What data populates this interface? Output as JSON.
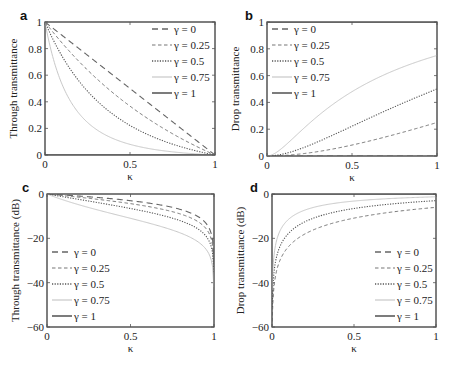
{
  "figure": {
    "legend_prefix": "γ = ",
    "xlabel": "κ"
  },
  "chart_data": [
    {
      "panel": "a",
      "type": "line",
      "title": "",
      "xlabel": "κ",
      "ylabel": "Through transmittance",
      "xlim": [
        0,
        1
      ],
      "ylim": [
        0,
        1
      ],
      "xticks": [
        "0",
        "0.5",
        "1"
      ],
      "yticks": [
        "0",
        "0.2",
        "0.4",
        "0.6",
        "0.8",
        "1"
      ],
      "legend_position": "upper right",
      "grid": false,
      "x": [
        0,
        0.1,
        0.2,
        0.3,
        0.4,
        0.5,
        0.6,
        0.7,
        0.8,
        0.9,
        1.0
      ],
      "series": [
        {
          "name": "γ = 0",
          "values": [
            1.0,
            0.9,
            0.8,
            0.7,
            0.6,
            0.5,
            0.4,
            0.3,
            0.2,
            0.1,
            0.0
          ]
        },
        {
          "name": "γ = 0.25",
          "values": [
            1.0,
            0.84,
            0.69,
            0.56,
            0.44,
            0.33,
            0.24,
            0.16,
            0.09,
            0.04,
            0.0
          ]
        },
        {
          "name": "γ = 0.5",
          "values": [
            1.0,
            0.74,
            0.56,
            0.41,
            0.31,
            0.22,
            0.16,
            0.1,
            0.06,
            0.02,
            0.0
          ]
        },
        {
          "name": "γ = 0.75",
          "values": [
            1.0,
            0.53,
            0.31,
            0.19,
            0.12,
            0.08,
            0.05,
            0.03,
            0.02,
            0.01,
            0.0
          ]
        },
        {
          "name": "γ = 1",
          "values": [
            0,
            0,
            0,
            0,
            0,
            0,
            0,
            0,
            0,
            0,
            0
          ]
        }
      ]
    },
    {
      "panel": "b",
      "type": "line",
      "title": "",
      "xlabel": "κ",
      "ylabel": "Drop transmittance",
      "xlim": [
        0,
        1
      ],
      "ylim": [
        0,
        1
      ],
      "xticks": [
        "0",
        "0.5",
        "1"
      ],
      "yticks": [
        "0",
        "0.2",
        "0.4",
        "0.6",
        "0.8",
        "1"
      ],
      "legend_position": "upper left",
      "grid": false,
      "x": [
        0,
        0.1,
        0.2,
        0.3,
        0.4,
        0.5,
        0.6,
        0.7,
        0.8,
        0.9,
        1.0
      ],
      "series": [
        {
          "name": "γ = 0",
          "values": [
            0,
            0,
            0,
            0,
            0,
            0,
            0,
            0,
            0,
            0,
            0
          ]
        },
        {
          "name": "γ = 0.25",
          "values": [
            0.0,
            0.004,
            0.016,
            0.035,
            0.058,
            0.082,
            0.11,
            0.14,
            0.17,
            0.21,
            0.25
          ]
        },
        {
          "name": "γ = 0.5",
          "values": [
            0.0,
            0.017,
            0.056,
            0.1,
            0.16,
            0.22,
            0.28,
            0.34,
            0.4,
            0.45,
            0.5
          ]
        },
        {
          "name": "γ = 0.75",
          "values": [
            0.0,
            0.064,
            0.19,
            0.3,
            0.39,
            0.48,
            0.55,
            0.61,
            0.66,
            0.71,
            0.75
          ]
        },
        {
          "name": "γ = 1",
          "values": [
            1,
            1,
            1,
            1,
            1,
            1,
            1,
            1,
            1,
            1,
            1
          ]
        }
      ]
    },
    {
      "panel": "c",
      "type": "line",
      "title": "",
      "xlabel": "κ",
      "ylabel": "Through transmittance (dB)",
      "xlim": [
        0,
        1
      ],
      "ylim": [
        -60,
        0
      ],
      "xticks": [
        "0",
        "0.5",
        "1"
      ],
      "yticks": [
        "-60",
        "-40",
        "-20",
        "0"
      ],
      "legend_position": "lower left",
      "grid": false,
      "x": [
        0,
        0.1,
        0.2,
        0.3,
        0.4,
        0.5,
        0.6,
        0.7,
        0.8,
        0.9,
        0.95,
        0.99
      ],
      "series": [
        {
          "name": "γ = 0",
          "values": [
            0,
            -0.46,
            -0.97,
            -1.55,
            -2.22,
            -3.01,
            -3.98,
            -5.23,
            -6.99,
            -10.0,
            -13.0,
            -20.0
          ]
        },
        {
          "name": "γ = 0.25",
          "values": [
            0,
            -0.76,
            -1.61,
            -2.52,
            -3.57,
            -4.81,
            -6.2,
            -7.96,
            -10.5,
            -14.0,
            -17.3,
            -24.4
          ]
        },
        {
          "name": "γ = 0.5",
          "values": [
            0,
            -1.3,
            -2.5,
            -3.8,
            -5.1,
            -6.5,
            -8.0,
            -10.0,
            -12.2,
            -16.0,
            -19.3,
            -26.5
          ]
        },
        {
          "name": "γ = 0.75",
          "values": [
            0,
            -2.8,
            -5.1,
            -7.2,
            -9.2,
            -11.0,
            -13.0,
            -15.2,
            -17.7,
            -21.4,
            -24.7,
            -31.9
          ]
        },
        {
          "name": "γ = 1",
          "values": [
            null,
            null,
            null,
            null,
            null,
            null,
            null,
            null,
            null,
            null,
            null,
            null
          ]
        }
      ]
    },
    {
      "panel": "d",
      "type": "line",
      "title": "",
      "xlabel": "κ",
      "ylabel": "Drop transmittance (dB)",
      "xlim": [
        0,
        1
      ],
      "ylim": [
        -60,
        0
      ],
      "xticks": [
        "0",
        "0.5",
        "1"
      ],
      "yticks": [
        "-60",
        "-40",
        "-20",
        "0"
      ],
      "legend_position": "lower right",
      "grid": false,
      "x": [
        0.01,
        0.03,
        0.05,
        0.1,
        0.2,
        0.3,
        0.4,
        0.5,
        0.6,
        0.7,
        0.8,
        0.9,
        1.0
      ],
      "series": [
        {
          "name": "γ = 0",
          "values": [
            null,
            null,
            null,
            null,
            null,
            null,
            null,
            null,
            null,
            null,
            null,
            null,
            null
          ]
        },
        {
          "name": "γ = 0.25",
          "values": [
            -45.2,
            -35.8,
            -31.4,
            -25.5,
            -19.8,
            -16.7,
            -14.6,
            -13.0,
            -11.8,
            -10.7,
            -9.8,
            -8.9,
            -6.0
          ]
        },
        {
          "name": "γ = 0.5",
          "values": [
            -37.1,
            -27.8,
            -23.6,
            -17.7,
            -12.3,
            -9.5,
            -7.7,
            -6.5,
            -5.6,
            -4.9,
            -4.3,
            -3.7,
            -3.0
          ]
        },
        {
          "name": "γ = 0.75",
          "values": [
            -28.6,
            -19.9,
            -16.0,
            -11.9,
            -7.2,
            -5.2,
            -4.1,
            -3.2,
            -2.6,
            -2.1,
            -1.8,
            -1.5,
            -1.25
          ]
        },
        {
          "name": "γ = 1",
          "values": [
            0,
            0,
            0,
            0,
            0,
            0,
            0,
            0,
            0,
            0,
            0,
            0,
            0
          ]
        }
      ]
    }
  ],
  "panels": [
    {
      "label": "a",
      "box": [
        45,
        22,
        215,
        155
      ],
      "ymin": 0,
      "ymax": 1,
      "legend": {
        "x": 152,
        "y": 33,
        "align": "right"
      }
    },
    {
      "label": "b",
      "box": [
        267,
        22,
        437,
        156
      ],
      "ymin": 0,
      "ymax": 1,
      "legend": {
        "x": 272,
        "y": 33,
        "align": "left"
      }
    },
    {
      "label": "c",
      "box": [
        47,
        194,
        214,
        327
      ],
      "ymin": -60,
      "ymax": 0,
      "legend": {
        "x": 52,
        "y": 256,
        "align": "left"
      }
    },
    {
      "label": "d",
      "box": [
        272,
        194,
        436,
        327
      ],
      "ymin": -60,
      "ymax": 0,
      "legend": {
        "x": 375,
        "y": 256,
        "align": "right"
      }
    }
  ],
  "series_styles": [
    {
      "name": "γ = 0",
      "color": "#666666",
      "dash": "6,4",
      "width": 1.1
    },
    {
      "name": "γ = 0.25",
      "color": "#777777",
      "dash": "3.5,2.5",
      "width": 1.0
    },
    {
      "name": "γ = 0.5",
      "color": "#555555",
      "dash": "1.2,1.4",
      "width": 1.1
    },
    {
      "name": "γ = 0.75",
      "color": "#c8c8c8",
      "dash": "",
      "width": 1.0
    },
    {
      "name": "γ = 1",
      "color": "#444444",
      "dash": "",
      "width": 1.2
    }
  ]
}
